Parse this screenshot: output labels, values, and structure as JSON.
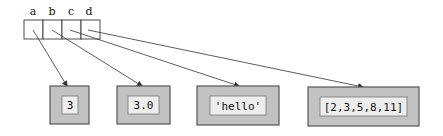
{
  "diagram": {
    "type": "memory-reference-diagram",
    "colors": {
      "outer_fill": "#c2c2c2",
      "outer_stroke": "#555555",
      "inner_fill": "#eeeeee",
      "inner_stroke": "#777777",
      "cell_stroke": "#222222",
      "arrow": "#333333"
    },
    "variables": [
      {
        "name": "a",
        "points_to": 0
      },
      {
        "name": "b",
        "points_to": 1
      },
      {
        "name": "c",
        "points_to": 2
      },
      {
        "name": "d",
        "points_to": 3
      }
    ],
    "objects": [
      {
        "value": "3"
      },
      {
        "value": "3.0"
      },
      {
        "value": "'hello'"
      },
      {
        "value": "[2,3,5,8,11]"
      }
    ]
  }
}
